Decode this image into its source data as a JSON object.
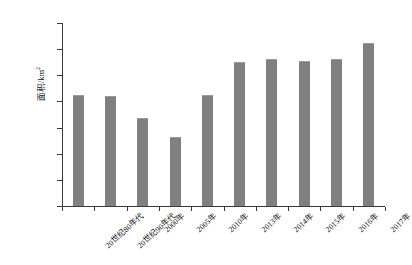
{
  "chart_data": {
    "type": "bar",
    "title": "",
    "subtitle": "",
    "xlabel": "",
    "ylabel": "面积/km2",
    "ylabel_base": "面积/km",
    "ylabel_sup": "2",
    "categories": [
      "20世纪80年代",
      "20世纪90年代",
      "2000年",
      "2005年",
      "2010年",
      "2013年",
      "2014年",
      "2015年",
      "2016年",
      "2017年"
    ],
    "values": [
      4362,
      4360,
      4319,
      4282,
      4362,
      4425,
      4431,
      4428,
      4432,
      4462
    ],
    "ylim": [
      4150,
      4500
    ],
    "ytick_values": [
      4150,
      4200,
      4250,
      4300,
      4350,
      4400,
      4450,
      4500
    ],
    "ytick_labels": [
      "4 150",
      "4 200",
      "4 250",
      "4 300",
      "4 350",
      "4 400",
      "4 450",
      "4 500"
    ],
    "grid": false,
    "legend": null,
    "legend_position": "none",
    "series_color": "#808080",
    "axis_color": "#3a3a3a",
    "background": "#ffffff"
  }
}
